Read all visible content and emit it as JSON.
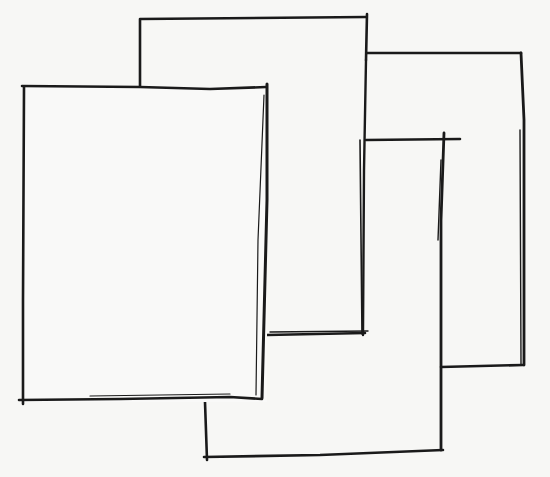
{
  "diagram": {
    "background": "#f7f7f5",
    "stroke_color": "#1a1a1a",
    "shapes": [
      {
        "id": "back-page",
        "label": "",
        "x": 140,
        "y": 17,
        "width": 227,
        "height": 318
      },
      {
        "id": "right-page",
        "label": "",
        "x": 367,
        "y": 52,
        "width": 157,
        "height": 314
      },
      {
        "id": "front-left-page",
        "label": "",
        "x": 22,
        "y": 86,
        "width": 245,
        "height": 316
      },
      {
        "id": "bottom-right-page",
        "label": "",
        "x": 205,
        "y": 137,
        "width": 237,
        "height": 321
      }
    ]
  }
}
